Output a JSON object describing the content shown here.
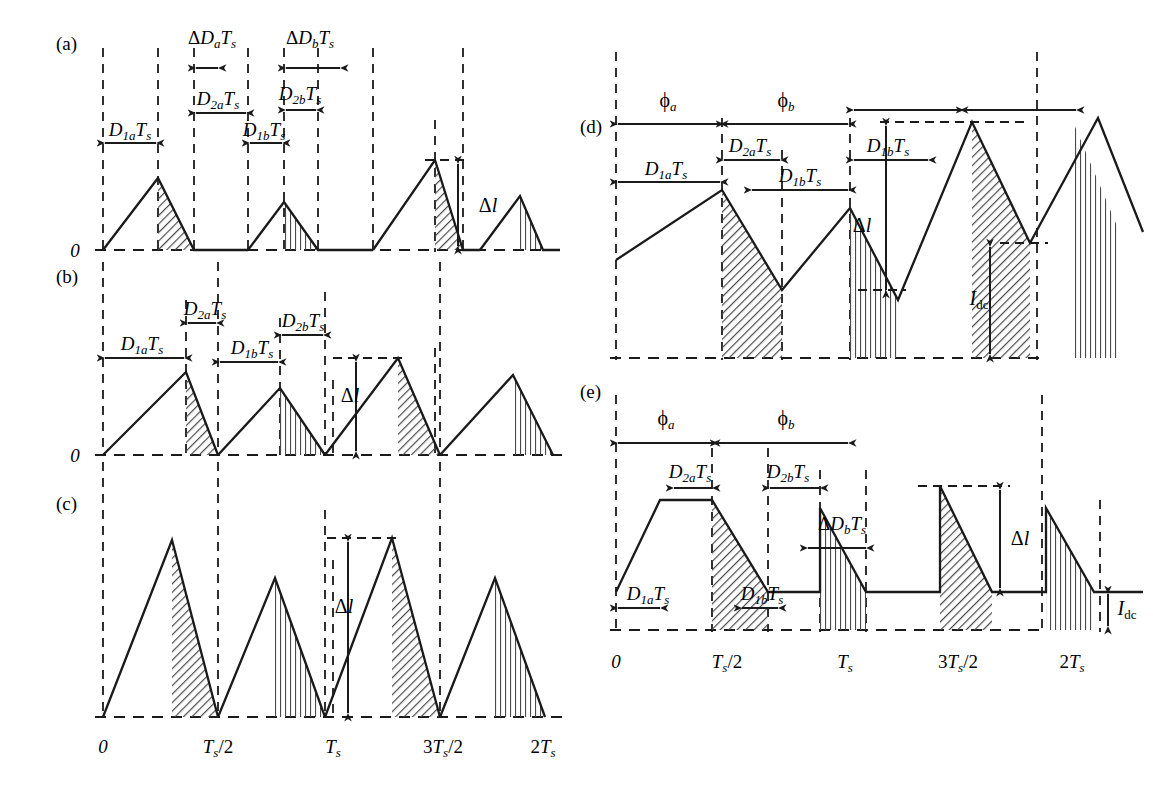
{
  "figure": {
    "axis_ticks": [
      "0",
      "T_s/2",
      "T_s",
      "3T_s/2",
      "2T_s"
    ],
    "zero_label": "0",
    "hatch_styles": [
      "diagonal",
      "vertical"
    ]
  },
  "panels": [
    {
      "id": "a",
      "label": "(a)",
      "zero_label": "0",
      "waveform": "discontinuous-triangular",
      "annotations": [
        {
          "name": "delta-D-a-Ts",
          "text": "ΔDₐTₛ"
        },
        {
          "name": "delta-D-b-Ts",
          "text": "ΔD_bTₛ"
        },
        {
          "name": "D-2a-Ts",
          "text": "D₂ₐTₛ"
        },
        {
          "name": "D-2b-Ts",
          "text": "D₂_bTₛ"
        },
        {
          "name": "D-1a-Ts",
          "text": "D₁ₐTₛ"
        },
        {
          "name": "D-1b-Ts",
          "text": "D₁_bTₛ"
        },
        {
          "name": "delta-l",
          "text": "Δl"
        }
      ]
    },
    {
      "id": "b",
      "label": "(b)",
      "zero_label": "0",
      "waveform": "continuous-triangular",
      "annotations": [
        {
          "name": "D-2a-Ts",
          "text": "D₂ₐTₛ"
        },
        {
          "name": "D-2b-Ts",
          "text": "D₂_bTₛ"
        },
        {
          "name": "D-1a-Ts",
          "text": "D₁ₐTₛ"
        },
        {
          "name": "D-1b-Ts",
          "text": "D₁_bTₛ"
        },
        {
          "name": "delta-l",
          "text": "Δl"
        }
      ]
    },
    {
      "id": "c",
      "label": "(c)",
      "zero_label": "",
      "waveform": "continuous-triangular-large",
      "annotations": [
        {
          "name": "delta-l",
          "text": "Δl"
        }
      ]
    },
    {
      "id": "d",
      "label": "(d)",
      "zero_label": "",
      "waveform": "triangular-with-dc-offset",
      "annotations": [
        {
          "name": "phi-a",
          "text": "ϕₐ"
        },
        {
          "name": "phi-b",
          "text": "ϕ_b"
        },
        {
          "name": "D-2a-Ts",
          "text": "D₂ₐTₛ"
        },
        {
          "name": "D-1b-Ts-upper",
          "text": "D₁_bTₛ"
        },
        {
          "name": "D-1a-Ts",
          "text": "D₁ₐTₛ"
        },
        {
          "name": "D-1b-Ts",
          "text": "D₁_bTₛ"
        },
        {
          "name": "delta-l",
          "text": "Δl"
        },
        {
          "name": "I-dc",
          "text": "Iₑₑ"
        }
      ],
      "idc_label": "I",
      "idc_sub": "dc"
    },
    {
      "id": "e",
      "label": "(e)",
      "zero_label": "",
      "waveform": "trapezoidal-with-dc-offset",
      "annotations": [
        {
          "name": "phi-a",
          "text": "ϕₐ"
        },
        {
          "name": "phi-b",
          "text": "ϕ_b"
        },
        {
          "name": "D-2a-Ts",
          "text": "D₂ₐTₛ"
        },
        {
          "name": "D-2b-Ts",
          "text": "D₂_bTₛ"
        },
        {
          "name": "delta-D-b-Ts",
          "text": "ΔD_bTₛ"
        },
        {
          "name": "D-1a-Ts",
          "text": "D₁ₐTₛ"
        },
        {
          "name": "D-1b-Ts",
          "text": "D₁_bTₛ"
        },
        {
          "name": "delta-l",
          "text": "Δl"
        },
        {
          "name": "I-dc",
          "text": "Iₑₑ"
        }
      ],
      "idc_label": "I",
      "idc_sub": "dc"
    }
  ],
  "symbols": {
    "D": "D",
    "T": "T",
    "s": "s",
    "a": "a",
    "b": "b",
    "one_a": "1a",
    "one_b": "1b",
    "two_a": "2a",
    "two_b": "2b",
    "delta": "Δ",
    "phi": "ϕ",
    "l": "l",
    "dc": "dc",
    "zero": "0",
    "half": "/2",
    "three": "3",
    "two": "2"
  },
  "colors": {
    "stroke": "#1a1a1a",
    "background": "#ffffff",
    "hatch": "#4a4a4a"
  }
}
